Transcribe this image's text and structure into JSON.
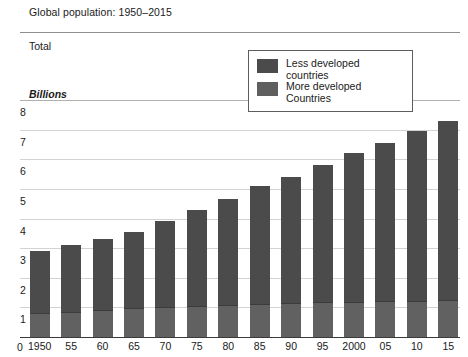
{
  "header": {
    "title": "Global population: 1950–2015",
    "series_band_label": "Total",
    "unit_label": "Billions"
  },
  "legend": {
    "items": [
      {
        "label_line1": "Less developed",
        "label_line2": "countries",
        "color": "#4b4b4b",
        "swatch_name": "legend-swatch-less-developed"
      },
      {
        "label_line1": "More developed",
        "label_line2": "Countries",
        "color": "#5f5f5f",
        "swatch_name": "legend-swatch-more-developed"
      }
    ]
  },
  "axes": {
    "y_ticks": [
      "8",
      "7",
      "6",
      "5",
      "4",
      "3",
      "2",
      "1"
    ],
    "y_zero": "0",
    "x_ticks": [
      "1950",
      "55",
      "60",
      "65",
      "70",
      "75",
      "80",
      "85",
      "90",
      "95",
      "2000",
      "05",
      "10",
      "15"
    ]
  },
  "chart_data": {
    "type": "bar",
    "title": "Global population: 1950–2015",
    "subtitle": "Total",
    "xlabel": "",
    "ylabel": "Billions",
    "ylim": [
      0,
      8
    ],
    "yticks": [
      0,
      1,
      2,
      3,
      4,
      5,
      6,
      7,
      8
    ],
    "grid": true,
    "stacked": true,
    "legend_position": "top-right-inside",
    "categories": [
      "1950",
      "55",
      "60",
      "65",
      "70",
      "75",
      "80",
      "85",
      "90",
      "95",
      "2000",
      "05",
      "10",
      "15"
    ],
    "series": [
      {
        "name": "More developed Countries",
        "color": "#5f5f5f",
        "values": [
          0.81,
          0.86,
          0.92,
          0.97,
          1.01,
          1.05,
          1.08,
          1.12,
          1.15,
          1.17,
          1.19,
          1.21,
          1.23,
          1.25
        ]
      },
      {
        "name": "Less developed countries",
        "color": "#4b4b4b",
        "values": [
          2.09,
          2.24,
          2.38,
          2.58,
          2.89,
          3.25,
          3.57,
          3.98,
          4.25,
          4.63,
          5.01,
          5.34,
          5.72,
          6.05
        ]
      }
    ],
    "totals": [
      2.9,
      3.1,
      3.3,
      3.55,
      3.9,
      4.3,
      4.65,
      5.1,
      5.4,
      5.8,
      6.2,
      6.55,
      6.95,
      7.3
    ]
  }
}
